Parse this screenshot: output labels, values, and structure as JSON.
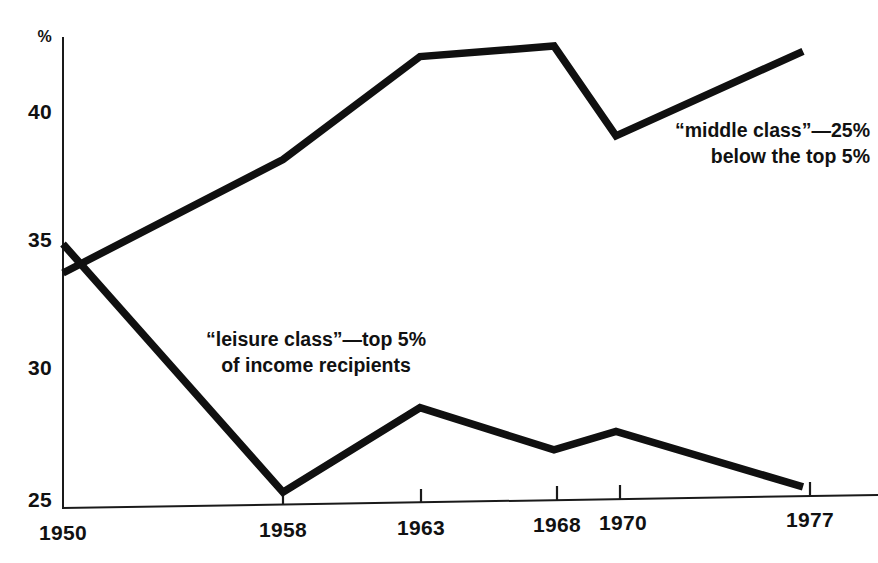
{
  "chart_data": {
    "type": "line",
    "title": "",
    "subtitle": "",
    "xlabel": "",
    "ylabel": "%",
    "x": [
      1950,
      1958,
      1963,
      1968,
      1970,
      1977
    ],
    "xtick_labels": [
      "1950",
      "1958",
      "1963",
      "1968",
      "1970",
      "1977"
    ],
    "ytick_labels": [
      "25",
      "30",
      "35",
      "40"
    ],
    "ytick_values": [
      25,
      30,
      35,
      40
    ],
    "ylim": [
      25,
      43
    ],
    "xlim": [
      1950,
      1977
    ],
    "grid": false,
    "legend": "inline-annotations",
    "series": [
      {
        "name": "“middle class”—25% below the top 5%",
        "values": [
          33.9,
          38.2,
          42.1,
          42.5,
          39.1,
          42.3
        ]
      },
      {
        "name": "“leisure class”—top 5% of income recipients",
        "values": [
          35.0,
          25.6,
          28.8,
          27.2,
          27.9,
          25.8
        ]
      }
    ],
    "annotations": [
      {
        "id": "middle-class",
        "line1": "“middle class”—25%",
        "line2": "below the top 5%"
      },
      {
        "id": "leisure-class",
        "line1": "“leisure class”—top 5%",
        "line2": "of income recipients"
      }
    ],
    "colors": {
      "line": "#101010",
      "axis": "#1a1a1a",
      "background": "#ffffff"
    }
  },
  "axis": {
    "y_unit": "%",
    "y_ticks": [
      {
        "label": "40"
      },
      {
        "label": "35"
      },
      {
        "label": "30"
      },
      {
        "label": "25"
      }
    ],
    "x_ticks": [
      {
        "label": "1950"
      },
      {
        "label": "1958"
      },
      {
        "label": "1963"
      },
      {
        "label": "1968"
      },
      {
        "label": "1970"
      },
      {
        "label": "1977"
      }
    ]
  },
  "annotations": {
    "middle_class": {
      "line1": "“middle class”—25%",
      "line2": "below the top 5%"
    },
    "leisure_class": {
      "line1": "“leisure class”—top 5%",
      "line2": "of income recipients"
    }
  }
}
